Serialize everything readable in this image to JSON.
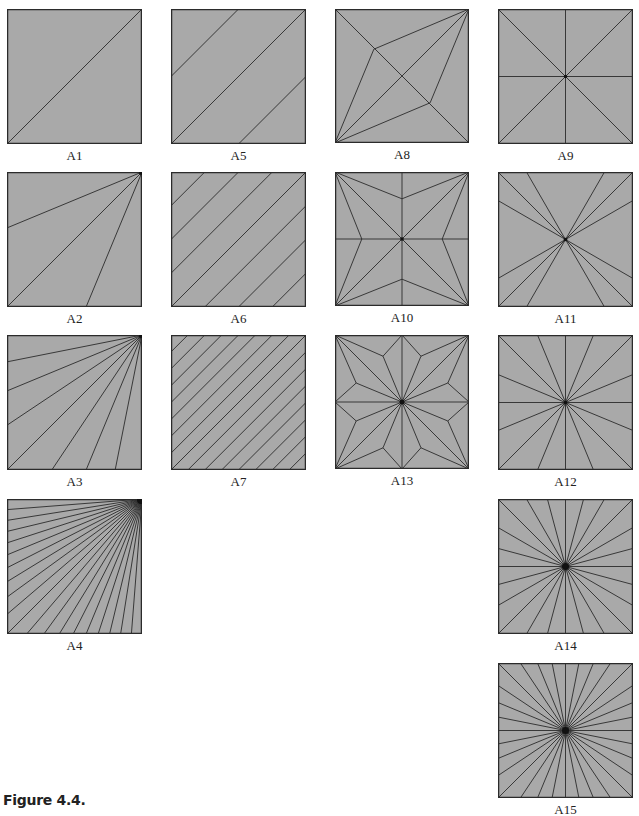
{
  "figure": {
    "caption": "Figure 4.4.",
    "colors": {
      "fill": "#a9a9a9",
      "line": "#2b2b2b",
      "background": "#ffffff"
    },
    "panels": [
      {
        "id": "A1",
        "label": "A1",
        "x": 7,
        "y": 9,
        "size": 135,
        "pattern": "parallel",
        "count": 1
      },
      {
        "id": "A5",
        "label": "A5",
        "x": 171,
        "y": 9,
        "size": 135,
        "pattern": "parallel",
        "count": 3
      },
      {
        "id": "A8",
        "label": "A8",
        "x": 335,
        "y": 9,
        "size": 134,
        "pattern": "kite8"
      },
      {
        "id": "A9",
        "label": "A9",
        "x": 498,
        "y": 9,
        "size": 135,
        "pattern": "radial",
        "count": 8
      },
      {
        "id": "A2",
        "label": "A2",
        "x": 7,
        "y": 172,
        "size": 135,
        "pattern": "fan",
        "count": 3
      },
      {
        "id": "A6",
        "label": "A6",
        "x": 171,
        "y": 172,
        "size": 135,
        "pattern": "parallel",
        "count": 7
      },
      {
        "id": "A10",
        "label": "A10",
        "x": 335,
        "y": 172,
        "size": 134,
        "pattern": "star10"
      },
      {
        "id": "A11",
        "label": "A11",
        "x": 498,
        "y": 172,
        "size": 135,
        "pattern": "radial11"
      },
      {
        "id": "A3",
        "label": "A3",
        "x": 7,
        "y": 335,
        "size": 135,
        "pattern": "fan",
        "count": 7
      },
      {
        "id": "A7",
        "label": "A7",
        "x": 171,
        "y": 335,
        "size": 135,
        "pattern": "parallel",
        "count": 15
      },
      {
        "id": "A13",
        "label": "A13",
        "x": 335,
        "y": 335,
        "size": 134,
        "pattern": "star13"
      },
      {
        "id": "A12",
        "label": "A12",
        "x": 498,
        "y": 335,
        "size": 135,
        "pattern": "radial",
        "count": 16
      },
      {
        "id": "A4",
        "label": "A4",
        "x": 7,
        "y": 499,
        "size": 135,
        "pattern": "fan",
        "count": 19
      },
      {
        "id": "A14",
        "label": "A14",
        "x": 498,
        "y": 499,
        "size": 135,
        "pattern": "radial",
        "count": 24
      },
      {
        "id": "A15",
        "label": "A15",
        "x": 498,
        "y": 663,
        "size": 135,
        "pattern": "radial",
        "count": 32
      }
    ]
  }
}
